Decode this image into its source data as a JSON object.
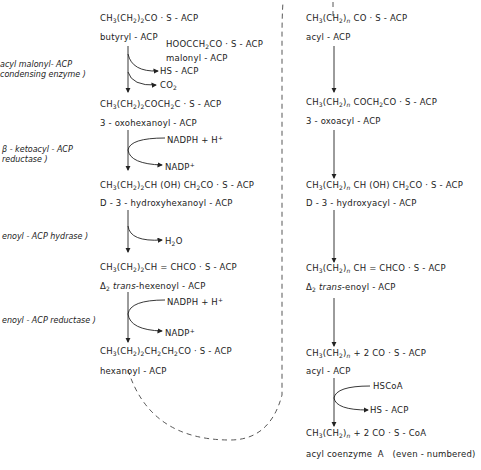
{
  "enzymes": {
    "condensing_1": "acyl malonyl- ACP",
    "condensing_2": "condensing enzyme )",
    "ketoreductase_1": "β - ketoacyl - ACP",
    "ketoreductase_2": "reductase )",
    "hydrase": "enoyl - ACP hydrase )",
    "enoyl_reductase": "enoyl - ACP reductase )"
  },
  "left_pathway": {
    "butyryl": {
      "formula": [
        "CH",
        "3",
        "(CH",
        "2",
        ")",
        "2",
        "CO · S - ACP"
      ],
      "name": "butyryl - ACP"
    },
    "malonyl": {
      "formula": [
        "HOOCCH",
        "2",
        "CO · S - ACP"
      ],
      "name": "malonyl - ACP"
    },
    "hs_acp": "HS - ACP",
    "co2": [
      "CO",
      "2"
    ],
    "oxohexanoyl": {
      "formula": [
        "CH",
        "3",
        "(CH",
        "2",
        ")",
        "2",
        "COCH",
        "2",
        "C · S - ACP"
      ],
      "name": "3 - oxohexanoyl - ACP"
    },
    "nadph_1": [
      "NADPH + H",
      "+"
    ],
    "nadp_1": [
      "NADP",
      "+"
    ],
    "hydroxyhexanoyl": {
      "formula": [
        "CH",
        "3",
        "(CH",
        "2",
        ")",
        "2",
        "CH (OH) CH",
        "2",
        "CO · S - ACP"
      ],
      "name": "D - 3 - hydroxyhexanoyl - ACP"
    },
    "h2o": [
      "H",
      "2",
      "O"
    ],
    "hexenoyl": {
      "formula": [
        "CH",
        "3",
        "(CH",
        "2",
        ")",
        "2",
        "CH = CHCO · S - ACP"
      ],
      "name_prefix": "Δ",
      "name_sub": "2",
      "name_italic": "trans",
      "name_rest": "-hexenoyl - ACP"
    },
    "nadph_2": [
      "NADPH + H",
      "+"
    ],
    "nadp_2": [
      "NADP",
      "+"
    ],
    "hexanoyl": {
      "formula": [
        "CH",
        "3",
        "(CH",
        "2",
        ")",
        "2",
        "CH",
        "2",
        "CH",
        "2",
        "CO · S - ACP"
      ],
      "name": "hexanoyl - ACP"
    }
  },
  "right_pathway": {
    "acyl": {
      "formula": [
        "CH",
        "3",
        "(CH",
        "2",
        ")",
        "n",
        "CO · S - ACP"
      ],
      "name": "acyl - ACP"
    },
    "oxoacyl": {
      "formula": [
        "CH",
        "3",
        "(CH",
        "2",
        ")",
        "n",
        "COCH",
        "2",
        "CO · S - ACP"
      ],
      "name": "3 - oxoacyl - ACP"
    },
    "hydroxyacyl": {
      "formula": [
        "CH",
        "3",
        "(CH",
        "2",
        ")",
        "n",
        "CH (OH) CH",
        "2",
        "CO · S - ACP"
      ],
      "name": "D - 3 - hydroxyacyl - ACP"
    },
    "enoyl": {
      "formula": [
        "CH",
        "3",
        "(CH",
        "2",
        ")",
        "n",
        "CH = CHCO · S - ACP"
      ],
      "name_prefix": "Δ",
      "name_sub": "2",
      "name_italic": "trans",
      "name_rest": "-enoyl - ACP"
    },
    "acyl2": {
      "formula": [
        "CH",
        "3",
        "(CH",
        "2",
        ")",
        "n",
        " + 2 CO · S - ACP"
      ],
      "name": "acyl - ACP"
    },
    "hscoa": "HSCoA",
    "hs_acp": "HS - ACP",
    "acylcoa": {
      "formula": [
        "CH",
        "3",
        "(CH",
        "2",
        ")",
        "n",
        " + 2 CO · S - CoA"
      ],
      "name": "acyl coenzyme  A   (even - numbered)"
    }
  },
  "colors": {
    "ink": "#222222",
    "background": "#ffffff"
  }
}
